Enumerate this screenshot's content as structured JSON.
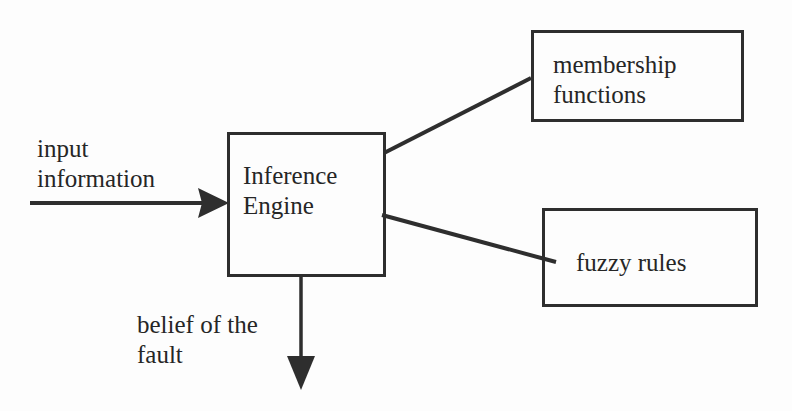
{
  "diagram": {
    "type": "block-diagram",
    "nodes": [
      {
        "id": "engine",
        "label_line1": "Inference",
        "label_line2": "Engine"
      },
      {
        "id": "membership",
        "label_line1": "membership",
        "label_line2": "functions"
      },
      {
        "id": "rules",
        "label": "fuzzy rules"
      }
    ],
    "edges": [
      {
        "from": "input",
        "to": "engine",
        "label_line1": "input",
        "label_line2": "information",
        "arrow": true
      },
      {
        "from": "engine",
        "to": "membership",
        "arrow": false
      },
      {
        "from": "engine",
        "to": "rules",
        "arrow": false
      },
      {
        "from": "engine",
        "to": "output",
        "label_line1": "belief of the",
        "label_line2": "fault",
        "arrow": true
      }
    ],
    "colors": {
      "stroke": "#2e2e2e",
      "text": "#262626",
      "background": "#fdfdfd"
    }
  }
}
